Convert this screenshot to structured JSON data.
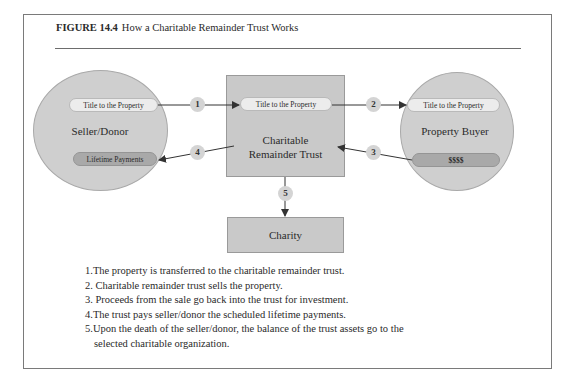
{
  "figure": {
    "label": "FIGURE 14.4",
    "title": "How a Charitable Remainder Trust Works"
  },
  "nodes": {
    "seller": {
      "label": "Seller/Donor",
      "top_pill": "Title to the Property",
      "bottom_pill": "Lifetime Payments"
    },
    "trust": {
      "label_line1": "Charitable",
      "label_line2": "Remainder Trust",
      "pill": "Title to the Property"
    },
    "buyer": {
      "label": "Property Buyer",
      "top_pill": "Title to the Property",
      "bottom_pill": "$$$$"
    },
    "charity": {
      "label": "Charity"
    }
  },
  "badges": [
    "1",
    "2",
    "3",
    "4",
    "5"
  ],
  "steps": [
    {
      "num": "1.",
      "text": "The property is transferred to the charitable remainder trust."
    },
    {
      "num": "2.",
      "text": " Charitable remainder trust sells the property."
    },
    {
      "num": "3.",
      "text": " Proceeds from the sale go back into the trust for investment."
    },
    {
      "num": "4.",
      "text": "The trust pays seller/donor the scheduled lifetime payments."
    },
    {
      "num": "5.",
      "text": "Upon the death of the seller/donor, the balance of the trust assets go to the",
      "cont": "selected charitable organization."
    }
  ],
  "colors": {
    "circle_fill": "#cfcfcf",
    "box_fill": "#c9c9c9",
    "pill_light": "#ececec",
    "pill_dark": "#a9a9a9",
    "badge_fill": "#d4d4d4",
    "arrow": "#333333"
  }
}
